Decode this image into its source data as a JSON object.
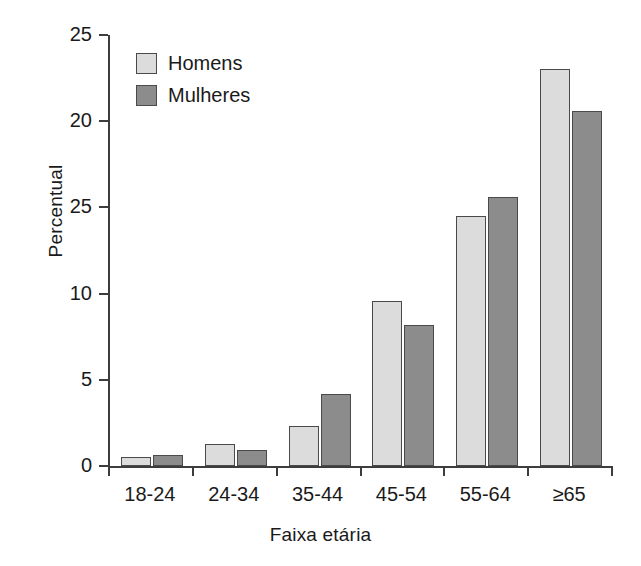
{
  "chart_data": {
    "type": "bar",
    "title": "",
    "xlabel": "Faixa etária",
    "ylabel": "Percentual",
    "categories": [
      "18-24",
      "24-34",
      "35-44",
      "45-54",
      "55-64",
      "≥65"
    ],
    "series": [
      {
        "name": "Homens",
        "color": "#dcdcdc",
        "values": [
          0.5,
          1.25,
          2.3,
          9.6,
          14.5,
          23.0
        ]
      },
      {
        "name": "Mulheres",
        "color": "#8c8c8c",
        "values": [
          0.65,
          0.9,
          4.2,
          8.2,
          15.6,
          20.6
        ]
      }
    ],
    "ylim": [
      0,
      25
    ],
    "ytick_values": [
      0,
      5,
      10,
      15,
      20,
      25
    ],
    "ytick_labels": [
      "0",
      "5",
      "10",
      "25",
      "20",
      "25"
    ],
    "grid": false,
    "legend_position": "top-left",
    "axis_color": "#3d3d3d",
    "text_color": "#1a1a1a",
    "background": "#ffffff"
  },
  "legend": {
    "items": [
      {
        "label": "Homens"
      },
      {
        "label": "Mulheres"
      }
    ]
  }
}
